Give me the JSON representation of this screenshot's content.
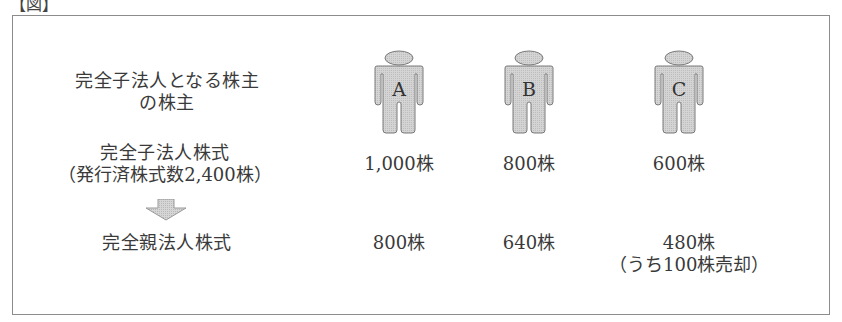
{
  "figure_label": "【図】",
  "rows": {
    "shareholders": {
      "label_line1": "完全子法人となる株主",
      "label_line2": "の株主"
    },
    "subsidiary_shares": {
      "label_line1": "完全子法人株式",
      "label_line2": "（発行済株式数2,400株）"
    },
    "parent_shares": {
      "label": "完全親法人株式"
    }
  },
  "arrow_icon": "down-arrow-icon",
  "shareholder_list": [
    {
      "name": "A",
      "subsidiary_shares": "1,000株",
      "parent_shares": "800株",
      "note": ""
    },
    {
      "name": "B",
      "subsidiary_shares": "800株",
      "parent_shares": "640株",
      "note": ""
    },
    {
      "name": "C",
      "subsidiary_shares": "600株",
      "parent_shares": "480株",
      "note": "（うち100株売却）"
    }
  ],
  "colors": {
    "figure_fill": "#cfcfcf",
    "figure_stroke": "#7a7a7a",
    "frame_border": "#8c8c8c",
    "text": "#3a3a3a"
  }
}
